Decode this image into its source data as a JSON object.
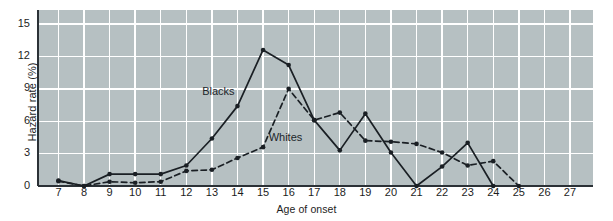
{
  "chart_data": {
    "type": "line",
    "title": "",
    "xlabel": "Age of onset",
    "ylabel": "Hazard rate (%)",
    "x": [
      7,
      8,
      9,
      10,
      11,
      12,
      13,
      14,
      15,
      16,
      17,
      18,
      19,
      20,
      21,
      22,
      23,
      24,
      25,
      26,
      27
    ],
    "xticklabels": [
      "7",
      "8",
      "9",
      "10",
      "11",
      "12",
      "13",
      "14",
      "15",
      "16",
      "17",
      "18",
      "19",
      "20",
      "21",
      "22",
      "23",
      "24",
      "25",
      "26",
      "27"
    ],
    "yticklabels": [
      "0",
      "3",
      "6",
      "9",
      "12",
      "15"
    ],
    "ytickvalues": [
      0,
      3,
      6,
      9,
      12,
      15
    ],
    "xlim": [
      6.2,
      27.9
    ],
    "ylim": [
      0,
      16.3
    ],
    "grid": true,
    "legend": "inline-annotations",
    "plot_bgcolor": "#b6c0c2",
    "gridcolor": "#ffffff",
    "linecolor": "#1a1f24",
    "series": [
      {
        "name": "Blacks",
        "style": "solid",
        "marker": "filled-circle",
        "values": [
          0.5,
          0.0,
          1.1,
          1.1,
          1.1,
          1.9,
          4.4,
          7.4,
          12.6,
          11.2,
          6.1,
          3.3,
          6.7,
          3.1,
          0.0,
          1.8,
          4.0,
          0.0,
          null,
          null,
          null
        ]
      },
      {
        "name": "Whites",
        "style": "dashed",
        "marker": "filled-circle",
        "values": [
          0.45,
          0.0,
          0.4,
          0.3,
          0.4,
          1.4,
          1.5,
          2.6,
          3.6,
          9.0,
          6.1,
          6.8,
          4.2,
          4.1,
          3.9,
          3.1,
          1.9,
          2.3,
          0.0,
          null,
          null
        ]
      }
    ],
    "annotations": [
      {
        "text": "Blacks",
        "x": 13.4,
        "y": 8.7
      },
      {
        "text": "Whites",
        "x": 16.0,
        "y": 4.4
      }
    ]
  }
}
